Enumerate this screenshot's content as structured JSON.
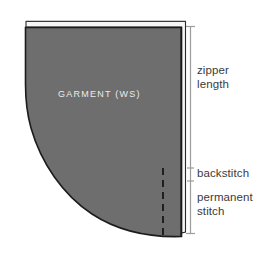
{
  "diagram": {
    "background_color": "#ffffff",
    "garment": {
      "label": "GARMENT (WS)",
      "fill_color": "#6e6e6e",
      "outline_color": "#1c1c1c",
      "label_color": "#ebebeb"
    },
    "seam_allowance_strip": {
      "name": "folded seam allowance",
      "fill_color": "#f7f7f7",
      "edge_color": "#2a2a2a"
    },
    "stitch_line": {
      "name": "permanent stitch line",
      "color": "#121212",
      "style": "dashed"
    },
    "measure": {
      "line_color": "#9c9c9c",
      "segments": [
        {
          "key": "zipper_length",
          "label": "zipper\nlength"
        },
        {
          "key": "backstitch",
          "label": "backstitch"
        },
        {
          "key": "permanent_stitch",
          "label": "permanent\nstitch"
        }
      ]
    }
  }
}
